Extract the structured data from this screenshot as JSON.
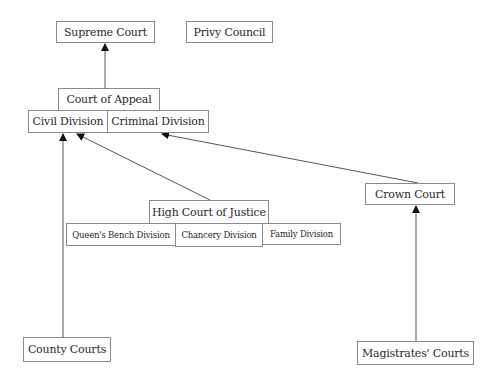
{
  "diagram": {
    "nodes": {
      "supreme_court": "Supreme Court",
      "privy_council": "Privy Council",
      "court_of_appeal": "Court of Appeal",
      "civil_division": "Civil Division",
      "criminal_division": "Criminal Division",
      "high_court": "High Court of Justice",
      "queens_bench": "Queen's Bench Division",
      "chancery": "Chancery Division",
      "family": "Family Division",
      "crown_court": "Crown Court",
      "county_courts": "County Courts",
      "magistrates_courts": "Magistrates' Courts"
    },
    "edges": [
      {
        "from": "court_of_appeal",
        "to": "supreme_court"
      },
      {
        "from": "county_courts",
        "to": "civil_division"
      },
      {
        "from": "high_court",
        "to": "civil_division"
      },
      {
        "from": "crown_court",
        "to": "criminal_division"
      },
      {
        "from": "magistrates_courts",
        "to": "crown_court"
      }
    ],
    "colors": {
      "border": "#8a8a8a",
      "line": "#555555",
      "arrowhead": "#111111",
      "text": "#2a2a2a"
    }
  }
}
